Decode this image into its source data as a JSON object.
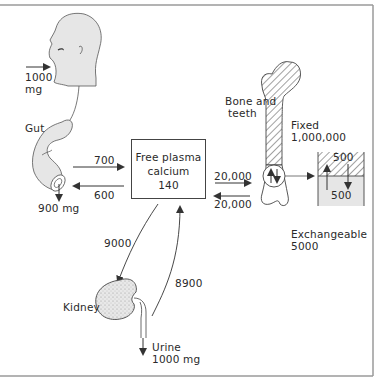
{
  "diagram": {
    "type": "calcium-metabolism-flow",
    "intake": {
      "amount": "1000",
      "unit": "mg"
    },
    "gut": {
      "label": "Gut",
      "fecal_output": "900 mg"
    },
    "gut_to_plasma": "700",
    "plasma_to_gut": "600",
    "plasma": {
      "line1": "Free plasma",
      "line2": "calcium",
      "value": "140"
    },
    "plasma_to_bone": "20,000",
    "bone_to_plasma": "20,000",
    "bone": {
      "line1": "Bone and",
      "line2": "teeth"
    },
    "fixed": {
      "label": "Fixed",
      "value": "1,000,000"
    },
    "exchange_box": {
      "top": "500",
      "bottom": "500"
    },
    "exchangeable": {
      "label": "Exchangeable",
      "value": "5000"
    },
    "plasma_to_kidney": "9000",
    "kidney_to_plasma": "8900",
    "kidney": {
      "label": "Kidney"
    },
    "urine": {
      "label": "Urine",
      "amount": "1000 mg"
    },
    "colors": {
      "border": "#9a9a9a",
      "ink": "#333333",
      "fill_gray": "#e6e6e6"
    }
  }
}
